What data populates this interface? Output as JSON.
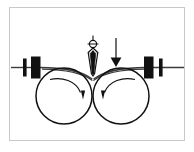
{
  "figure": {
    "title": "Nip roller wedge insertion diagram",
    "caption": "",
    "background_color": "#ffffff",
    "frame_color": "#c9c9c9",
    "ink_color": "#111111",
    "line_color": "#3a3a3a"
  },
  "elements": {
    "left_roller": {
      "label": "left roller",
      "rotation_label": "clockwise",
      "center_x": 64,
      "center_y": 96,
      "radius": 28
    },
    "right_roller": {
      "label": "right roller",
      "rotation_label": "counter-clockwise",
      "center_x": 121,
      "center_y": 96,
      "radius": 28
    },
    "wedge": {
      "label": "wedge needle",
      "tip_x": 93,
      "tip_y": 73
    },
    "force_arrow": {
      "label": "downward force arrow",
      "direction": "down",
      "x": 116,
      "top_y": 38,
      "bottom_y": 66
    },
    "web_line": {
      "label": "web sheet",
      "y": 67
    },
    "left_guide_blocks": {
      "label": "left guide blocks",
      "thin_bar_x": 25,
      "thick_bar_x": 33
    },
    "right_guide_blocks": {
      "label": "right guide blocks",
      "thick_bar_x": 147,
      "thin_bar_x": 161
    }
  }
}
